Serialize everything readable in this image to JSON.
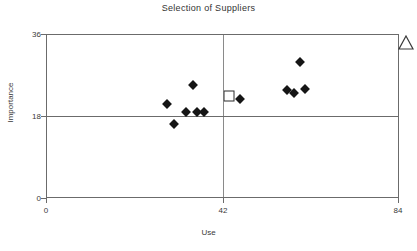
{
  "chart_data": {
    "type": "scatter",
    "title": "Selection of Suppliers",
    "xlabel": "Use",
    "ylabel": "Importance",
    "xlim": [
      0,
      84
    ],
    "ylim": [
      0,
      36
    ],
    "xticks": [
      0,
      42,
      84
    ],
    "yticks": [
      0,
      18,
      36
    ],
    "xtick_labels": [
      "0",
      "42",
      "84"
    ],
    "ytick_labels": [
      "0",
      "18",
      "36"
    ],
    "grid": false,
    "legend": "none",
    "quadrant_lines": {
      "vertical_x": 42,
      "horizontal_y": 18,
      "color": "#7a7a7a"
    },
    "series": [
      {
        "name": "Suppliers",
        "marker": "filled-diamond",
        "color": "#151515",
        "points": [
          {
            "x": 28.6,
            "y": 20.6
          },
          {
            "x": 30.5,
            "y": 16.2
          },
          {
            "x": 33.3,
            "y": 18.9
          },
          {
            "x": 35.0,
            "y": 24.8
          },
          {
            "x": 36.0,
            "y": 18.9
          },
          {
            "x": 37.6,
            "y": 18.9
          },
          {
            "x": 46.2,
            "y": 21.7
          },
          {
            "x": 57.4,
            "y": 23.7
          },
          {
            "x": 59.0,
            "y": 23.1
          },
          {
            "x": 60.5,
            "y": 29.9
          },
          {
            "x": 61.7,
            "y": 23.9
          }
        ]
      },
      {
        "name": "Selected supplier",
        "marker": "open-square",
        "color": "#2b2b2b",
        "points": [
          {
            "x": 43.6,
            "y": 22.4
          }
        ]
      },
      {
        "name": "Target",
        "marker": "open-triangle",
        "color": "#3a3a3a",
        "points": [
          {
            "x": 84.0,
            "y": 36.0
          }
        ]
      }
    ]
  }
}
